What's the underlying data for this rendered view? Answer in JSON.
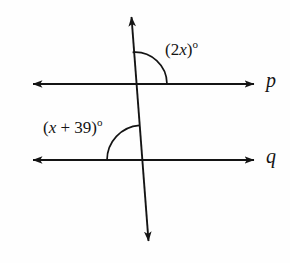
{
  "figure": {
    "background_color": "#fefefe",
    "stroke_color": "#141414",
    "width": 290,
    "height": 263
  },
  "lines": {
    "p": {
      "name": "p",
      "label": "p",
      "y": 84,
      "x_start": 27,
      "x_end": 260,
      "arrows": "both"
    },
    "q": {
      "name": "q",
      "label": "q",
      "y": 160,
      "x_start": 27,
      "x_end": 260,
      "arrows": "both"
    },
    "transversal": {
      "name": "transversal",
      "label": "",
      "x_top": 131,
      "y_top": 10,
      "x_bottom": 149,
      "y_bottom": 248,
      "arrows": "both"
    }
  },
  "intersections": {
    "with_p": {
      "x": 135,
      "y": 84
    },
    "with_q": {
      "x": 142,
      "y": 160
    }
  },
  "angles": [
    {
      "id": "angle-2x",
      "expression": "(2x)",
      "expression_prefix": "(2",
      "variable": "x",
      "expression_suffix": ")",
      "degree_symbol": "o",
      "full_text": "(2x)o",
      "vertex": {
        "x": 135,
        "y": 84
      },
      "arc_radius": 32,
      "position": "upper-right",
      "label_x": 165,
      "label_y": 39
    },
    {
      "id": "angle-x-plus-39",
      "expression": "(x + 39)",
      "expression_prefix": "(",
      "variable": "x",
      "expression_suffix": " + 39)",
      "degree_symbol": "o",
      "full_text": "(x + 39)o",
      "vertex": {
        "x": 142,
        "y": 160
      },
      "arc_radius": 35,
      "position": "upper-left",
      "label_x": 43,
      "label_y": 117
    }
  ]
}
